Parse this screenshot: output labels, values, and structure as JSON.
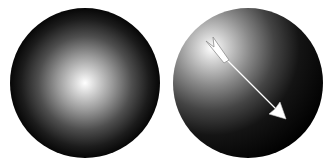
{
  "diagram": {
    "background": "#ffffff",
    "spheres": [
      {
        "id": "sphere-centered-light",
        "cx": 85,
        "cy": 83,
        "r": 75,
        "highlight_cx": 85,
        "highlight_cy": 83,
        "highlight_color": "#ffffff",
        "mid_color": "#7a7a7a",
        "edge_color": "#000000"
      },
      {
        "id": "sphere-directional-light",
        "cx": 248,
        "cy": 83,
        "r": 75,
        "highlight_cx": 210,
        "highlight_cy": 45,
        "highlight_color": "#ffffff",
        "mid_color": "#6e6e6e",
        "edge_color": "#000000"
      }
    ],
    "arrow": {
      "tail_x": 222,
      "tail_y": 55,
      "head_x": 286,
      "head_y": 119,
      "color": "#ffffff",
      "outline": "#9a9a9a"
    }
  }
}
